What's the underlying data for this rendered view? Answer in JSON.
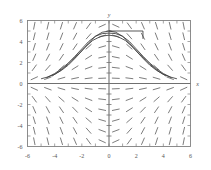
{
  "figure": {
    "kind": "slope-field-plot",
    "background": "#ffffff",
    "frame_color": "#808080",
    "axis_color": "#707070",
    "tick_color": "#808080",
    "label_color": "#555555",
    "slope_mark_color": "#6e6e6e",
    "curve_color": "#3a3a3a"
  },
  "chart_data": {
    "type": "line",
    "title": "",
    "subtitle": "",
    "xlabel": "x",
    "ylabel": "y",
    "xlim": [
      -6,
      6
    ],
    "ylim": [
      -6,
      6
    ],
    "grid": false,
    "legend": "none",
    "x_ticks": [
      -6,
      -4,
      -2,
      0,
      2,
      4,
      6
    ],
    "x_tick_labels": [
      "-6",
      "-4",
      "-2",
      "0",
      "2",
      "4",
      "6"
    ],
    "y_ticks": [
      -6,
      -4,
      -2,
      0,
      2,
      4,
      6
    ],
    "y_tick_labels": [
      "-6",
      "-4",
      "-2",
      "0",
      "2",
      "4",
      "6"
    ],
    "minor_tick_step": 1,
    "slope_field": {
      "description": "direction field of dy/dx = -x*y/5 style decreasing-after-peak family",
      "x_samples": [
        -5.5,
        -4.5,
        -3.5,
        -2.5,
        -1.5,
        -0.5,
        0.5,
        1.5,
        2.5,
        3.5,
        4.5,
        5.5
      ],
      "y_samples": [
        -5.5,
        -4.5,
        -3.5,
        -2.5,
        -1.5,
        -0.5,
        0.5,
        1.5,
        2.5,
        3.5,
        4.5,
        5.5
      ],
      "mark_length": 7
    },
    "series": [
      {
        "name": "solution-curve-1",
        "peak": [
          0,
          5
        ],
        "x": [
          -5.0,
          -4.5,
          -4.0,
          -3.5,
          -3.0,
          -2.5,
          -2.0,
          -1.5,
          -1.0,
          -0.5,
          0.0,
          0.5,
          1.0,
          1.5,
          2.0,
          2.5,
          3.0,
          3.5,
          4.0,
          4.5,
          5.0
        ],
        "values": [
          0.45,
          0.62,
          0.88,
          1.25,
          1.75,
          2.4,
          3.1,
          3.85,
          4.5,
          4.88,
          5.0,
          4.88,
          4.5,
          3.85,
          3.1,
          2.4,
          1.75,
          1.25,
          0.88,
          0.62,
          0.45
        ]
      },
      {
        "name": "solution-curve-2",
        "peak": [
          0,
          4.8
        ],
        "x": [
          -4.6,
          -4.0,
          -3.5,
          -3.0,
          -2.5,
          -2.0,
          -1.5,
          -1.0,
          -0.5,
          0.0,
          0.5,
          1.0,
          1.5,
          2.0,
          2.5,
          3.0,
          3.5,
          4.0,
          4.6
        ],
        "values": [
          0.55,
          0.95,
          1.4,
          1.95,
          2.6,
          3.3,
          4.0,
          4.5,
          4.75,
          4.8,
          4.75,
          4.5,
          4.0,
          3.3,
          2.6,
          1.95,
          1.4,
          0.95,
          0.55
        ]
      },
      {
        "name": "solution-curve-3",
        "peak": [
          0,
          4.6
        ],
        "x": [
          -4.2,
          -3.6,
          -3.0,
          -2.4,
          -1.8,
          -1.2,
          -0.6,
          0.0,
          0.6,
          1.2,
          1.8,
          2.4,
          3.0,
          3.6,
          4.2
        ],
        "values": [
          0.7,
          1.2,
          1.85,
          2.6,
          3.4,
          4.1,
          4.5,
          4.6,
          4.5,
          4.1,
          3.4,
          2.6,
          1.85,
          1.2,
          0.7
        ]
      }
    ],
    "annotations": [
      {
        "name": "horizontal-segment",
        "type": "segment",
        "x0": 0.0,
        "y0": 5.0,
        "x1": 2.5,
        "y1": 5.0
      },
      {
        "name": "vertical-drop-segment",
        "type": "segment",
        "x0": 2.5,
        "y0": 5.0,
        "x1": 2.5,
        "y1": 4.25
      }
    ]
  }
}
